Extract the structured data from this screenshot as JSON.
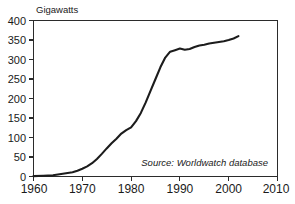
{
  "chart_data": {
    "type": "line",
    "title": "",
    "ylabel": "Gigawatts",
    "xlabel": "",
    "xlim": [
      1960,
      2010
    ],
    "ylim": [
      0,
      400
    ],
    "grid": false,
    "legend": null,
    "annotations": [
      {
        "name": "source-note",
        "text": "Source: Worldwatch database",
        "style": "italic",
        "position": "inside-bottom-right"
      }
    ],
    "xticks": [
      1960,
      1970,
      1980,
      1990,
      2000,
      2010
    ],
    "xtick_labels": [
      "1960",
      "1970",
      "1980",
      "1990",
      "2000",
      "2010"
    ],
    "yticks": [
      0,
      50,
      100,
      150,
      200,
      250,
      300,
      350,
      400
    ],
    "ytick_labels": [
      "0",
      "50",
      "100",
      "150",
      "200",
      "250",
      "300",
      "350",
      "400"
    ],
    "series": [
      {
        "name": "Installed nuclear generating capacity",
        "color": "#1c1c1c",
        "x": [
          1960,
          1962,
          1964,
          1965,
          1966,
          1967,
          1968,
          1969,
          1970,
          1971,
          1972,
          1973,
          1974,
          1975,
          1976,
          1977,
          1978,
          1979,
          1980,
          1981,
          1982,
          1983,
          1984,
          1985,
          1986,
          1987,
          1988,
          1989,
          1990,
          1991,
          1992,
          1993,
          1994,
          1995,
          1996,
          1997,
          1998,
          1999,
          2000,
          2001,
          2002
        ],
        "y": [
          1,
          2,
          3,
          5,
          7,
          9,
          11,
          15,
          20,
          26,
          34,
          45,
          58,
          72,
          85,
          97,
          110,
          119,
          126,
          142,
          163,
          190,
          220,
          250,
          280,
          305,
          320,
          324,
          328,
          325,
          327,
          332,
          336,
          338,
          341,
          343,
          345,
          347,
          350,
          354,
          360
        ]
      }
    ],
    "units": "GW",
    "value_range_note": "0 to 400 Gigawatts"
  },
  "figure": {
    "background_color": "#ffffff",
    "frame_color": "#2b2b2b",
    "line_color": "#1c1c1c"
  }
}
